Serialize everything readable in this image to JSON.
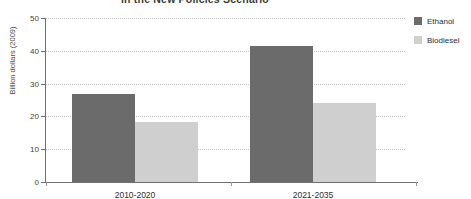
{
  "chart_data": {
    "type": "bar",
    "title": "in the New Policies Scenario",
    "subtitle": "",
    "xlabel": "",
    "ylabel": "Billion dollars (2009)",
    "categories": [
      "2010-2020",
      "2021-2035"
    ],
    "series": [
      {
        "name": "Ethanol",
        "color": "#6b6b6b",
        "values": [
          26.8,
          41.5
        ]
      },
      {
        "name": "Biodiesel",
        "color": "#cfcfcf",
        "values": [
          18.3,
          24.1
        ]
      }
    ],
    "ylim": [
      0,
      50
    ],
    "yticks": [
      0,
      10,
      20,
      30,
      40,
      50
    ],
    "ytick_labels": [
      "0",
      "10",
      "20",
      "30",
      "40",
      "50"
    ],
    "grid": true,
    "legend_position": "right"
  },
  "legend": {
    "items": [
      {
        "label": "Ethanol",
        "swatch": "ethanol"
      },
      {
        "label": "Biodiesel",
        "swatch": "biodiesel"
      }
    ]
  }
}
